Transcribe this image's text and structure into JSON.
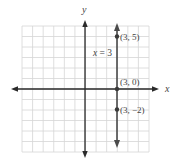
{
  "chart_data": {
    "type": "line",
    "title": "",
    "xlabel": "x",
    "ylabel": "y",
    "xlim": [
      -6,
      6
    ],
    "ylim": [
      -6,
      6
    ],
    "grid": true,
    "series": [
      {
        "name": "x = 3",
        "kind": "vertical-line",
        "x_value": 3,
        "points": [
          {
            "x": 3,
            "y": 5,
            "label": "(3, 5)"
          },
          {
            "x": 3,
            "y": 0,
            "label": "(3, 0)"
          },
          {
            "x": 3,
            "y": -2,
            "label": "(3, −2)"
          }
        ]
      }
    ],
    "annotations": [
      {
        "text": "x = 3",
        "x": 1.4,
        "y": 3.4
      }
    ]
  },
  "labels": {
    "x_axis": "x",
    "y_axis": "y",
    "line": "x = 3",
    "p1": "(3, 5)",
    "p2": "(3, 0)",
    "p3": "(3, −2)"
  },
  "colors": {
    "grid": "#d6d6d6",
    "axes": "#2a2a2a",
    "line": "#4a4a4a",
    "points": "#3a3a3a",
    "text": "#444444"
  }
}
